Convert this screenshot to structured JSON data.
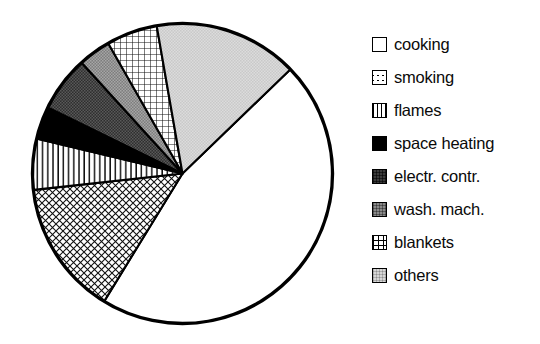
{
  "chart_data": {
    "type": "pie",
    "title": "",
    "categories": [
      "cooking",
      "smoking",
      "flames",
      "space heating",
      "electr. contr.",
      "wash. mach.",
      "blankets",
      "others"
    ],
    "values": [
      46.0,
      14.5,
      5.5,
      3.5,
      6.0,
      3.5,
      5.5,
      15.5
    ],
    "unit": "%",
    "start_angle_deg": 46,
    "direction": "clockwise",
    "legend_position": "right",
    "grid": false,
    "slices": [
      {
        "label": "cooking",
        "value": 46.0,
        "pattern": "solid-white",
        "fill": "#ffffff",
        "start_deg": 46,
        "end_deg": 211.5
      },
      {
        "label": "smoking",
        "value": 14.5,
        "pattern": "cross-hatch",
        "fill": "#ffffff",
        "start_deg": 211.5,
        "end_deg": 263.7
      },
      {
        "label": "flames",
        "value": 5.5,
        "pattern": "vertical-lines",
        "fill": "#ffffff",
        "start_deg": 263.7,
        "end_deg": 283.5
      },
      {
        "label": "space heating",
        "value": 3.5,
        "pattern": "solid-black",
        "fill": "#000000",
        "start_deg": 283.5,
        "end_deg": 296.1
      },
      {
        "label": "electr. contr.",
        "value": 6.0,
        "pattern": "dark-gray",
        "fill": "#3b3b3b",
        "start_deg": 296.1,
        "end_deg": 317.7
      },
      {
        "label": "wash. mach.",
        "value": 3.5,
        "pattern": "mid-gray",
        "fill": "#8a8a8a",
        "start_deg": 317.7,
        "end_deg": 330.3
      },
      {
        "label": "blankets",
        "value": 5.5,
        "pattern": "white-grid",
        "fill": "#ffffff",
        "start_deg": 330.3,
        "end_deg": 350.1
      },
      {
        "label": "others",
        "value": 15.5,
        "pattern": "light-gray",
        "fill": "#d6d6d6",
        "start_deg": 350.1,
        "end_deg": 406.0
      }
    ],
    "colors": {
      "outline": "#000000",
      "background": "#ffffff",
      "text": "#0a0a0a"
    }
  },
  "legend": {
    "items": [
      {
        "label": "cooking",
        "swatch": "solid-white-swatch"
      },
      {
        "label": "smoking",
        "swatch": "cross-hatch-swatch"
      },
      {
        "label": "flames",
        "swatch": "vertical-lines-swatch"
      },
      {
        "label": "space heating",
        "swatch": "solid-black-swatch"
      },
      {
        "label": "electr. contr.",
        "swatch": "dark-gray-swatch"
      },
      {
        "label": "wash. mach.",
        "swatch": "mid-gray-swatch"
      },
      {
        "label": "blankets",
        "swatch": "white-grid-swatch"
      },
      {
        "label": "others",
        "swatch": "light-gray-swatch"
      }
    ]
  }
}
